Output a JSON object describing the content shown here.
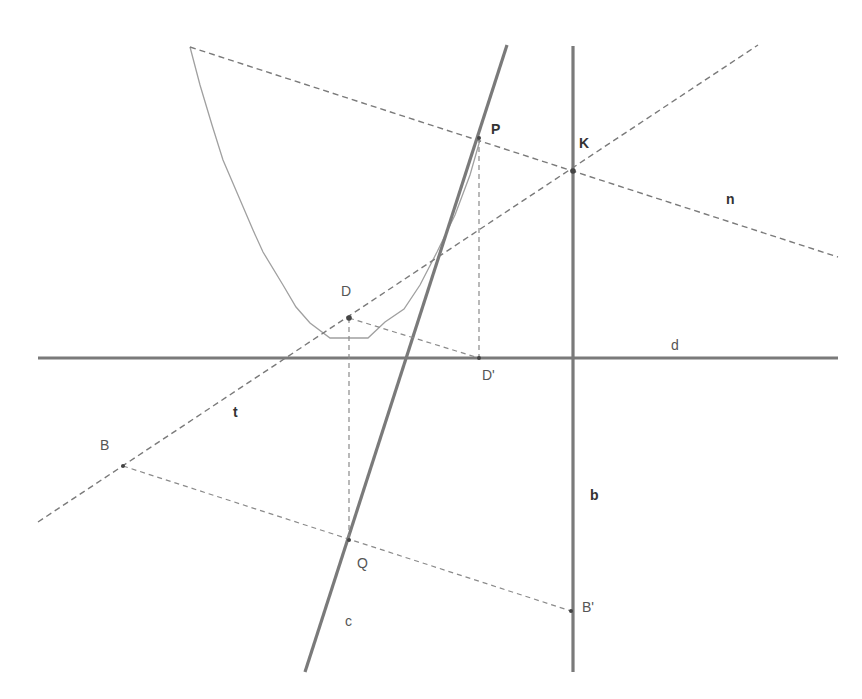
{
  "diagram": {
    "type": "geometric-construction",
    "colors": {
      "thick_line": "#7a7a7a",
      "dashed_line": "#8a8a8a",
      "curve": "#a0a0a0",
      "point": "#444444",
      "label": "#555555",
      "label_bold": "#333333"
    },
    "lines": {
      "d": {
        "label": "d",
        "style": "solid-thick",
        "x1": 38,
        "y1": 358,
        "x2": 838,
        "y2": 358
      },
      "b": {
        "label": "b",
        "style": "solid-thick",
        "x1": 573,
        "y1": 46,
        "x2": 573,
        "y2": 672
      },
      "c": {
        "label": "c",
        "style": "solid-thick",
        "x1": 507,
        "y1": 45,
        "x2": 305,
        "y2": 672
      },
      "n": {
        "label": "n",
        "style": "dashed",
        "x1": 190,
        "y1": 47,
        "x2": 838,
        "y2": 257
      },
      "t": {
        "label": "t",
        "style": "dashed",
        "x1": 38,
        "y1": 522,
        "x2": 758,
        "y2": 45
      }
    },
    "segments": [
      {
        "name": "D-Dprime",
        "x1": 349,
        "y1": 318,
        "x2": 479,
        "y2": 358
      },
      {
        "name": "D-Q",
        "x1": 349,
        "y1": 318,
        "x2": 349,
        "y2": 540
      },
      {
        "name": "P-Dprime",
        "x1": 479,
        "y1": 138,
        "x2": 479,
        "y2": 358
      },
      {
        "name": "B-Bprime",
        "x1": 123,
        "y1": 466,
        "x2": 571,
        "y2": 611
      }
    ],
    "points": {
      "P": {
        "label": "P",
        "x": 479,
        "y": 138,
        "label_x": 491,
        "label_y": 122,
        "bold": true
      },
      "K": {
        "label": "K",
        "x": 573,
        "y": 171,
        "label_x": 579,
        "label_y": 136,
        "bold": true
      },
      "D": {
        "label": "D",
        "x": 349,
        "y": 318,
        "label_x": 341,
        "label_y": 284,
        "bold": false
      },
      "Dprime": {
        "label": "D'",
        "x": 479,
        "y": 358,
        "label_x": 482,
        "label_y": 368,
        "bold": false
      },
      "B": {
        "label": "B",
        "x": 123,
        "y": 466,
        "label_x": 100,
        "label_y": 438,
        "bold": false
      },
      "Bprime": {
        "label": "B'",
        "x": 571,
        "y": 611,
        "label_x": 582,
        "label_y": 600,
        "bold": false
      },
      "Q": {
        "label": "Q",
        "x": 349,
        "y": 540,
        "label_x": 357,
        "label_y": 556,
        "bold": false
      }
    },
    "line_labels": {
      "n": {
        "text": "n",
        "x": 726,
        "y": 192,
        "bold": true
      },
      "d": {
        "text": "d",
        "x": 671,
        "y": 338,
        "bold": false
      },
      "t": {
        "text": "t",
        "x": 233,
        "y": 405,
        "bold": true
      },
      "b": {
        "text": "b",
        "x": 590,
        "y": 488,
        "bold": true
      },
      "c": {
        "text": "c",
        "x": 345,
        "y": 614,
        "bold": false
      }
    },
    "parabola": {
      "label": "parabola",
      "points": "190,47 200,85 212,125 223,160 238,195 253,230 263,252 283,285 296,307 310,323 330,338 368,338 385,322 404,309 420,285 437,252 455,215 470,175 480,140"
    }
  }
}
